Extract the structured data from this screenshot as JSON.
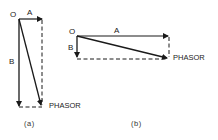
{
  "diagrams": [
    {
      "id": "a",
      "caption": "(a)",
      "labels": {
        "origin": "O",
        "vector_a": "A",
        "vector_b": "B",
        "resultant": "PHASOR"
      }
    },
    {
      "id": "b",
      "caption": "(b)",
      "labels": {
        "origin": "O",
        "vector_a": "A",
        "vector_b": "B",
        "resultant": "PHASOR"
      }
    }
  ],
  "colors": {
    "stroke": "#1a1a1a",
    "background": "#ffffff"
  }
}
